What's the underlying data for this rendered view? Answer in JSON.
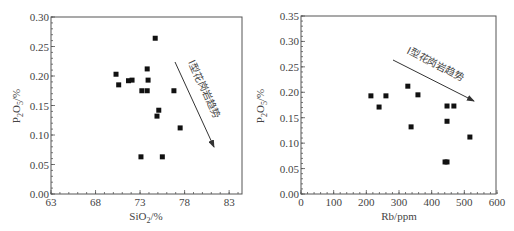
{
  "chart_data": [
    {
      "type": "scatter",
      "title": "",
      "xlabel": "SiO2/%",
      "ylabel": "P2O5/%",
      "xlim": [
        63,
        84.5
      ],
      "ylim": [
        0,
        0.3
      ],
      "xticks": [
        63,
        68,
        73,
        78,
        83
      ],
      "yticks": [
        0.0,
        0.05,
        0.1,
        0.15,
        0.2,
        0.25,
        0.3
      ],
      "grid": false,
      "legend": null,
      "annotation": {
        "text": "I型花岗岩趋势",
        "arrow_from": [
          77.7,
          0.225
        ],
        "arrow_to": [
          82.1,
          0.08
        ]
      },
      "x": [
        74.7,
        70.3,
        70.6,
        71.7,
        72.1,
        73.8,
        73.9,
        73.2,
        73.8,
        76.8,
        75.1,
        74.9,
        77.5,
        73.1,
        75.5
      ],
      "y": [
        0.264,
        0.203,
        0.185,
        0.192,
        0.193,
        0.212,
        0.193,
        0.175,
        0.175,
        0.175,
        0.142,
        0.132,
        0.112,
        0.063,
        0.063
      ]
    },
    {
      "type": "scatter",
      "title": "",
      "xlabel": "Rb/ppm",
      "ylabel": "P2O5/%",
      "xlim": [
        0,
        600
      ],
      "ylim": [
        0,
        0.35
      ],
      "xticks": [
        0,
        100,
        200,
        300,
        400,
        500,
        600
      ],
      "yticks": [
        0.0,
        0.05,
        0.1,
        0.15,
        0.2,
        0.25,
        0.3,
        0.35
      ],
      "grid": false,
      "legend": null,
      "annotation": {
        "text": "I型花岗岩趋势",
        "arrow_from": [
          282,
          0.263
        ],
        "arrow_to": [
          530,
          0.182
        ]
      },
      "x": [
        214,
        239,
        260,
        327,
        337,
        358,
        447,
        468,
        447,
        517,
        441,
        447
      ],
      "y": [
        0.193,
        0.171,
        0.193,
        0.212,
        0.132,
        0.195,
        0.173,
        0.173,
        0.143,
        0.112,
        0.063,
        0.063
      ]
    }
  ],
  "left": {
    "xlabel_main": "SiO",
    "xlabel_sub": "2",
    "xlabel_tail": "/%",
    "ylabel_main": "P",
    "ylabel_sub1": "2",
    "ylabel_mid": "O",
    "ylabel_sub2": "5",
    "ylabel_tail": "/%",
    "xtick_labels": [
      "63",
      "68",
      "73",
      "78",
      "83"
    ],
    "ytick_labels": [
      "0.00",
      "0.05",
      "0.10",
      "0.15",
      "0.20",
      "0.25",
      "0.30"
    ],
    "annotation": "I型花岗岩趋势"
  },
  "right": {
    "xlabel": "Rb/ppm",
    "ylabel_main": "P",
    "ylabel_sub1": "2",
    "ylabel_mid": "O",
    "ylabel_sub2": "5",
    "ylabel_tail": "/%",
    "xtick_labels": [
      "0",
      "100",
      "200",
      "300",
      "400",
      "500",
      "600"
    ],
    "ytick_labels": [
      "0.00",
      "0.05",
      "0.10",
      "0.15",
      "0.20",
      "0.25",
      "0.30",
      "0.35"
    ],
    "annotation": "I型花岗岩趋势"
  }
}
